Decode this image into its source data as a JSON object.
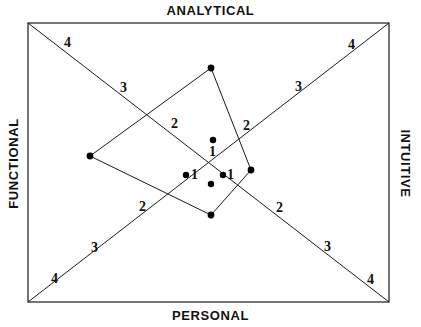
{
  "chart_data": {
    "type": "scatter",
    "title": "",
    "axes": {
      "top": "ANALYTICAL",
      "bottom": "PERSONAL",
      "left": "FUNCTIONAL",
      "right": "INTUITIVE"
    },
    "frame": {
      "x1": 28,
      "y1": 23,
      "x2": 389,
      "y2": 302
    },
    "center": {
      "x": 208,
      "y": 162
    },
    "grid": false,
    "legend": false,
    "ring_labels": [
      {
        "text": "4",
        "x": 68,
        "y": 43,
        "quadrant": "analytical-functional"
      },
      {
        "text": "3",
        "x": 124,
        "y": 88,
        "quadrant": "analytical-functional"
      },
      {
        "text": "2",
        "x": 175,
        "y": 124,
        "quadrant": "analytical-functional"
      },
      {
        "text": "1",
        "x": 213,
        "y": 152,
        "quadrant": "analytical-center"
      },
      {
        "text": "4",
        "x": 352,
        "y": 45,
        "quadrant": "analytical-intuitive"
      },
      {
        "text": "3",
        "x": 299,
        "y": 87,
        "quadrant": "analytical-intuitive"
      },
      {
        "text": "2",
        "x": 247,
        "y": 126,
        "quadrant": "analytical-intuitive"
      },
      {
        "text": "1",
        "x": 195,
        "y": 175,
        "quadrant": "functional-center"
      },
      {
        "text": "1",
        "x": 231,
        "y": 175,
        "quadrant": "intuitive-center"
      },
      {
        "text": "2",
        "x": 143,
        "y": 207,
        "quadrant": "personal-functional"
      },
      {
        "text": "3",
        "x": 95,
        "y": 248,
        "quadrant": "personal-functional"
      },
      {
        "text": "4",
        "x": 55,
        "y": 279,
        "quadrant": "personal-functional"
      },
      {
        "text": "2",
        "x": 280,
        "y": 208,
        "quadrant": "personal-intuitive"
      },
      {
        "text": "3",
        "x": 328,
        "y": 247,
        "quadrant": "personal-intuitive"
      },
      {
        "text": "4",
        "x": 371,
        "y": 280,
        "quadrant": "personal-intuitive"
      }
    ],
    "polygon": {
      "closed": true,
      "vertices": [
        {
          "x": 211,
          "y": 68,
          "name": "analytical-vertex"
        },
        {
          "x": 251,
          "y": 170,
          "name": "intuitive-vertex"
        },
        {
          "x": 211,
          "y": 215,
          "name": "personal-vertex"
        },
        {
          "x": 90,
          "y": 156,
          "name": "functional-vertex"
        }
      ]
    },
    "points": [
      {
        "x": 211,
        "y": 68,
        "label": ""
      },
      {
        "x": 90,
        "y": 156,
        "label": ""
      },
      {
        "x": 251,
        "y": 170,
        "label": ""
      },
      {
        "x": 211,
        "y": 215,
        "label": ""
      },
      {
        "x": 213,
        "y": 140,
        "label": ""
      },
      {
        "x": 186,
        "y": 175,
        "label": ""
      },
      {
        "x": 211,
        "y": 184,
        "label": ""
      },
      {
        "x": 223,
        "y": 175,
        "label": ""
      }
    ],
    "diagonals": [
      {
        "from": {
          "x": 28,
          "y": 23
        },
        "to": {
          "x": 389,
          "y": 302
        }
      },
      {
        "from": {
          "x": 389,
          "y": 23
        },
        "to": {
          "x": 28,
          "y": 302
        }
      }
    ],
    "colors": {
      "stroke": "#1a1a1a",
      "point": "#000000",
      "background": "#ffffff",
      "text": "#111111"
    }
  }
}
